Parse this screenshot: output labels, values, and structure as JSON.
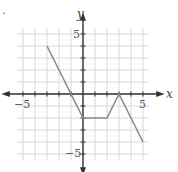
{
  "chart_data": {
    "type": "line",
    "title": "",
    "xlabel": "x",
    "ylabel": "y",
    "xlim": [
      -5.5,
      5.5
    ],
    "ylim": [
      -5.5,
      5.5
    ],
    "grid": true,
    "tick_labels": {
      "x": [
        "-5",
        "5"
      ],
      "y": [
        "5",
        "-5"
      ]
    },
    "series": [
      {
        "name": "f",
        "x": [
          -3,
          0,
          2,
          3,
          5
        ],
        "y": [
          4,
          -2,
          -2,
          0,
          -4
        ]
      }
    ],
    "colors": {
      "line": "#8a8a8a",
      "axis": "#333333",
      "grid": "#d8d8d8"
    }
  },
  "labels": {
    "x_axis": "x",
    "y_axis": "y",
    "x_neg": "−5",
    "x_pos": "5",
    "y_pos": "5",
    "y_neg": "−5",
    "marker": "."
  }
}
